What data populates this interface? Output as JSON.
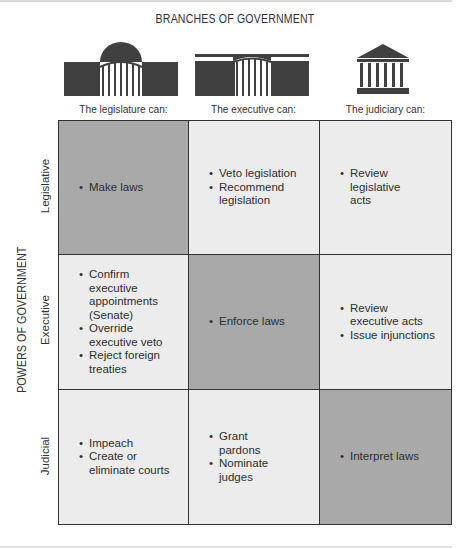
{
  "title": "BRANCHES OF GOVERNMENT",
  "axis_label": "POWERS OF GOVERNMENT",
  "colors": {
    "highlight_cell": "#a9a9a9",
    "plain_cell": "#ececec",
    "border": "#333333",
    "icon": "#404040"
  },
  "columns": [
    {
      "icon": "capitol-dome-icon",
      "label": "The legislature can:"
    },
    {
      "icon": "white-house-icon",
      "label": "The executive can:"
    },
    {
      "icon": "supreme-court-icon",
      "label": "The judiciary can:"
    }
  ],
  "rows": [
    {
      "label": "Legislative",
      "cells": [
        {
          "highlight": true,
          "items": [
            "Make laws"
          ]
        },
        {
          "highlight": false,
          "items": [
            "Veto legislation",
            "Recommend legislation"
          ]
        },
        {
          "highlight": false,
          "items": [
            "Review legislative acts"
          ]
        }
      ]
    },
    {
      "label": "Executive",
      "cells": [
        {
          "highlight": false,
          "items": [
            "Confirm executive appointments (Senate)",
            "Override executive veto",
            "Reject foreign treaties"
          ]
        },
        {
          "highlight": true,
          "items": [
            "Enforce laws"
          ]
        },
        {
          "highlight": false,
          "items": [
            "Review executive acts",
            "Issue injunctions"
          ]
        }
      ]
    },
    {
      "label": "Judicial",
      "cells": [
        {
          "highlight": false,
          "items": [
            "Impeach",
            "Create or eliminate courts"
          ]
        },
        {
          "highlight": false,
          "items": [
            "Grant pardons",
            "Nominate judges"
          ]
        },
        {
          "highlight": true,
          "items": [
            "Interpret laws"
          ]
        }
      ]
    }
  ]
}
